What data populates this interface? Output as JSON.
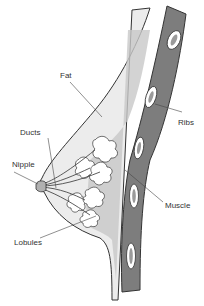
{
  "diagram": {
    "labels": {
      "fat": "Fat",
      "ducts": "Ducts",
      "nipple": "Nipple",
      "lobules": "Lobules",
      "ribs": "Ribs",
      "muscle": "Muscle"
    },
    "colors": {
      "background": "#ffffff",
      "outline": "#333333",
      "fat_fill": "#ececec",
      "tissue_fill": "#c8c8c8",
      "muscle_fill": "#7d7d7d",
      "rib_fill": "#ffffff",
      "rib_core": "#9a9a9a",
      "lobule_fill": "#ffffff"
    }
  }
}
